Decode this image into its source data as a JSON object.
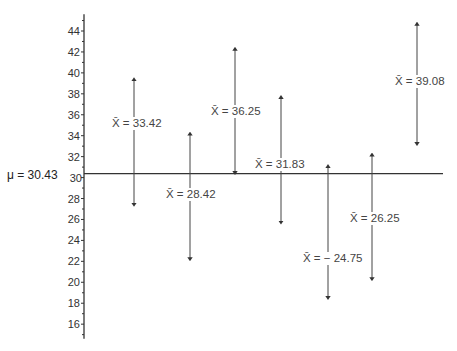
{
  "population_mean": {
    "symbol": "μ",
    "label": "μ = 30.43",
    "value": 30.43
  },
  "axis": {
    "ticks": [
      16,
      18,
      20,
      22,
      24,
      26,
      28,
      30,
      32,
      34,
      36,
      38,
      40,
      42,
      44
    ],
    "min": 15,
    "max": 45.5
  },
  "chart_data": {
    "type": "interval",
    "title": "",
    "xlabel": "",
    "ylabel": "",
    "ylim": [
      15,
      45.5
    ],
    "reference_line": {
      "label": "μ = 30.43",
      "value": 30.43
    },
    "intervals": [
      {
        "label": "X̄ = 33.42",
        "mean": 33.42,
        "low": 27.4,
        "high": 39.4
      },
      {
        "label": "X̄ = 28.42",
        "mean": 28.42,
        "low": 22.2,
        "high": 34.2
      },
      {
        "label": "X̄ = 36.25",
        "mean": 36.25,
        "low": 30.43,
        "high": 42.3
      },
      {
        "label": "X̄ = 31.83",
        "mean": 31.83,
        "low": 25.7,
        "high": 37.7
      },
      {
        "label": "X̄ = −24.75",
        "mean": 24.75,
        "low": 18.5,
        "high": 31.1
      },
      {
        "label": "X̄ = 26.25",
        "mean": 26.25,
        "low": 20.3,
        "high": 32.2
      },
      {
        "label": "X̄ = 39.08",
        "mean": 39.08,
        "low": 33.2,
        "high": 44.7
      }
    ]
  },
  "intervals": [
    {
      "text": "X̄ = 33.42"
    },
    {
      "text": "X̄ = 28.42"
    },
    {
      "text": "X̄ = 36.25"
    },
    {
      "text": "X̄ = 31.83"
    },
    {
      "text": "X̄ = − 24.75"
    },
    {
      "text": "X̄ = 26.25"
    },
    {
      "text": "X̄ = 39.08"
    }
  ]
}
